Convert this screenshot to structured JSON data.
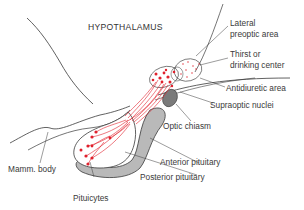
{
  "diagram": {
    "title": "HYPOTHALAMUS",
    "colors": {
      "neuron": "#e0202c",
      "outline": "#3a3a3a",
      "pituitary_fill": "#b9b9b9",
      "chiasm_fill": "#7a7a7a",
      "text": "#3a3a3a"
    },
    "labels": {
      "lateral_preoptic_line1": "Lateral",
      "lateral_preoptic_line2": "preoptic area",
      "thirst_line1": "Thirst or",
      "thirst_line2": "drinking center",
      "antidiuretic": "Antidiuretic area",
      "supraoptic": "Supraoptic nuclei",
      "optic_chiasm": "Optic chiasm",
      "anterior_pituitary": "Anterior pituitary",
      "posterior_pituitary": "Posterior pituitary",
      "mamm_body": "Mamm. body",
      "pituicytes": "Pituicytes"
    }
  }
}
